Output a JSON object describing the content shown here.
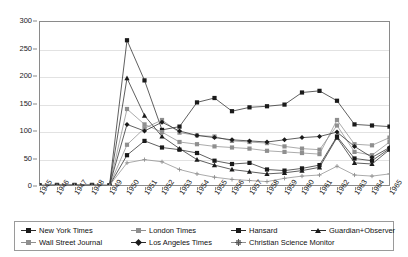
{
  "chart_data": {
    "type": "line",
    "title": "",
    "subtitle": "",
    "xlabel": "",
    "ylabel": "",
    "grid": true,
    "legend_position": "bottom",
    "ylim": [
      0,
      300
    ],
    "yticks": [
      0,
      50,
      100,
      150,
      200,
      250,
      300
    ],
    "categories": [
      "1945",
      "1946",
      "1947",
      "1948",
      "1949",
      "1950",
      "1951",
      "1952",
      "1953",
      "1954",
      "1955",
      "1956",
      "1957",
      "1958",
      "1959",
      "1960",
      "1961",
      "1962",
      "1963",
      "1964",
      "1965"
    ],
    "series": [
      {
        "name": "New York Times",
        "marker": "square",
        "tone": "dark",
        "values": [
          1,
          2,
          2,
          2,
          1,
          265,
          192,
          102,
          108,
          152,
          160,
          136,
          143,
          145,
          148,
          170,
          173,
          155,
          112,
          110,
          108
        ]
      },
      {
        "name": "Wall Street Journal",
        "marker": "square",
        "tone": "light",
        "values": [
          1,
          1,
          1,
          1,
          1,
          140,
          112,
          98,
          80,
          76,
          72,
          70,
          68,
          64,
          62,
          60,
          58,
          120,
          76,
          74,
          88
        ]
      },
      {
        "name": "London Times",
        "marker": "square",
        "tone": "light",
        "values": [
          1,
          1,
          1,
          1,
          1,
          75,
          105,
          120,
          97,
          92,
          90,
          82,
          80,
          78,
          72,
          68,
          66,
          110,
          62,
          56,
          80
        ]
      },
      {
        "name": "Los Angeles Times",
        "marker": "diamond",
        "tone": "dark",
        "values": [
          1,
          1,
          1,
          1,
          1,
          112,
          100,
          116,
          100,
          92,
          88,
          84,
          82,
          80,
          84,
          88,
          90,
          98,
          72,
          52,
          70
        ]
      },
      {
        "name": "Hansard",
        "marker": "square",
        "tone": "dark",
        "values": [
          1,
          1,
          1,
          1,
          1,
          56,
          82,
          70,
          66,
          60,
          46,
          40,
          42,
          30,
          28,
          32,
          38,
          90,
          50,
          46,
          68
        ]
      },
      {
        "name": "Guardian+Observer",
        "marker": "triangle",
        "tone": "dark",
        "values": [
          1,
          1,
          1,
          1,
          1,
          196,
          128,
          90,
          68,
          48,
          38,
          30,
          26,
          22,
          24,
          28,
          34,
          88,
          42,
          40,
          66
        ]
      },
      {
        "name": "Christian Science Monitor",
        "marker": "cross",
        "tone": "light",
        "values": [
          1,
          1,
          1,
          1,
          1,
          42,
          48,
          44,
          30,
          22,
          16,
          12,
          10,
          8,
          14,
          18,
          20,
          36,
          20,
          18,
          22
        ]
      }
    ]
  },
  "legend": {
    "items": [
      {
        "label": "New York Times",
        "marker": "square",
        "tone": "dark",
        "col": 0,
        "row": 0
      },
      {
        "label": "Wall Street Journal",
        "marker": "square",
        "tone": "light",
        "col": 0,
        "row": 1
      },
      {
        "label": "London Times",
        "marker": "square",
        "tone": "light",
        "col": 1,
        "row": 0
      },
      {
        "label": "Los Angeles Times",
        "marker": "diamond",
        "tone": "dark",
        "col": 1,
        "row": 1
      },
      {
        "label": "Hansard",
        "marker": "square",
        "tone": "dark",
        "col": 2,
        "row": 0
      },
      {
        "label": "Christian Science Monitor",
        "marker": "cross",
        "tone": "light",
        "col": 2,
        "row": 1
      },
      {
        "label": "Guardian+Observer",
        "marker": "triangle",
        "tone": "dark",
        "col": 3,
        "row": 0
      }
    ]
  },
  "colors": {
    "line_dark": "#2b2b2b",
    "line_light": "#8f8f8f",
    "grid": "#e2e2e2",
    "axis": "#8a8a8a",
    "background": "#ffffff"
  }
}
